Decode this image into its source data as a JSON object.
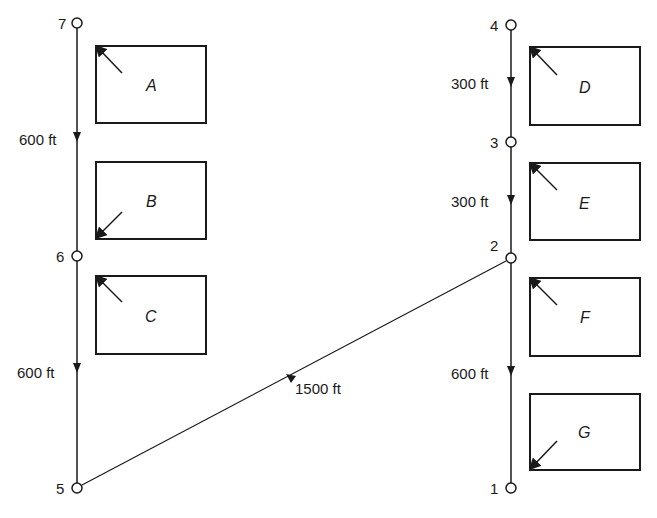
{
  "diagram": {
    "nodes": [
      {
        "id": "7",
        "label": "7",
        "x": 77,
        "y": 23
      },
      {
        "id": "6",
        "label": "6",
        "x": 77,
        "y": 256
      },
      {
        "id": "5",
        "label": "5",
        "x": 77,
        "y": 488
      },
      {
        "id": "4",
        "label": "4",
        "x": 511,
        "y": 25
      },
      {
        "id": "3",
        "label": "3",
        "x": 511,
        "y": 142
      },
      {
        "id": "2",
        "label": "2",
        "x": 511,
        "y": 258
      },
      {
        "id": "1",
        "label": "1",
        "x": 511,
        "y": 488
      }
    ],
    "edges": [
      {
        "from": "7",
        "to": "6",
        "label": "600 ft"
      },
      {
        "from": "6",
        "to": "5",
        "label": "600 ft"
      },
      {
        "from": "5",
        "to": "2",
        "label": "1500 ft"
      },
      {
        "from": "4",
        "to": "3",
        "label": "300 ft"
      },
      {
        "from": "3",
        "to": "2",
        "label": "300 ft"
      },
      {
        "from": "2",
        "to": "1",
        "label": "600 ft"
      }
    ],
    "blocks": [
      {
        "label": "A",
        "corner_arrow": "top-left"
      },
      {
        "label": "B",
        "corner_arrow": "bottom-left"
      },
      {
        "label": "C",
        "corner_arrow": "top-left"
      },
      {
        "label": "D",
        "corner_arrow": "top-left"
      },
      {
        "label": "E",
        "corner_arrow": "top-left"
      },
      {
        "label": "F",
        "corner_arrow": "top-left"
      },
      {
        "label": "G",
        "corner_arrow": "bottom-left"
      }
    ]
  }
}
